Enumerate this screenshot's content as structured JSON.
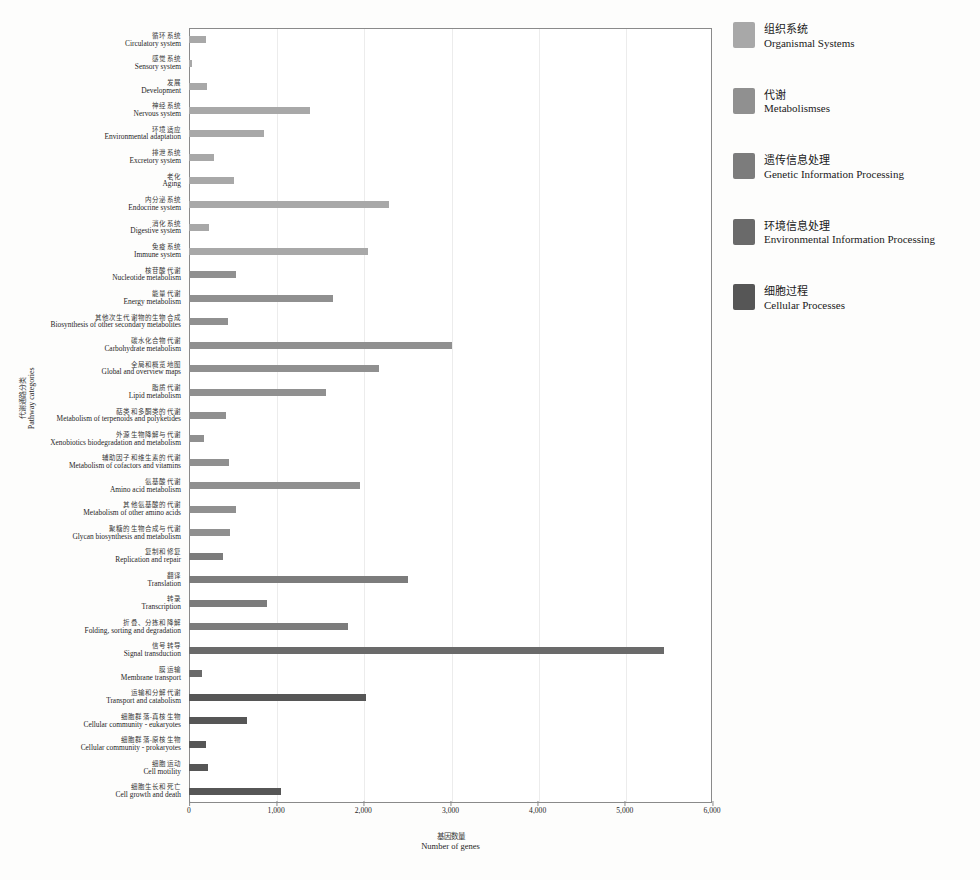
{
  "chart_data": {
    "type": "bar",
    "orientation": "horizontal",
    "title": "",
    "xlabel_cn": "基因数量",
    "xlabel_en": "Number of genes",
    "ylabel_cn": "代谢通路分类",
    "ylabel_en": "Pathway categories",
    "xlim": [
      0,
      6000
    ],
    "xticks": [
      0,
      1000,
      2000,
      3000,
      4000,
      5000,
      6000
    ],
    "xtick_labels": [
      "0",
      "1,000",
      "2,000",
      "3,000",
      "4,000",
      "5,000",
      "6,000"
    ],
    "grid": true,
    "legend_position": "right",
    "categories": [
      {
        "cn": "循环系统",
        "en": "Circulatory system",
        "value": 200,
        "group": "Organismal Systems"
      },
      {
        "cn": "感觉系统",
        "en": "Sensory system",
        "value": 40,
        "group": "Organismal Systems"
      },
      {
        "cn": "发展",
        "en": "Development",
        "value": 210,
        "group": "Organismal Systems"
      },
      {
        "cn": "神经系统",
        "en": "Nervous system",
        "value": 1390,
        "group": "Organismal Systems"
      },
      {
        "cn": "环境适应",
        "en": "Environmental adaptation",
        "value": 860,
        "group": "Organismal Systems"
      },
      {
        "cn": "排泄系统",
        "en": "Excretory system",
        "value": 285,
        "group": "Organismal Systems"
      },
      {
        "cn": "老化",
        "en": "Aging",
        "value": 520,
        "group": "Organismal Systems"
      },
      {
        "cn": "内分泌系统",
        "en": "Endocrine system",
        "value": 2290,
        "group": "Organismal Systems"
      },
      {
        "cn": "消化系统",
        "en": "Digestive system",
        "value": 225,
        "group": "Organismal Systems"
      },
      {
        "cn": "免疫系统",
        "en": "Immune system",
        "value": 2050,
        "group": "Organismal Systems"
      },
      {
        "cn": "核苷酸代谢",
        "en": "Nucleotide metabolism",
        "value": 540,
        "group": "Metabolismses"
      },
      {
        "cn": "能量代谢",
        "en": "Energy metabolism",
        "value": 1650,
        "group": "Metabolismses"
      },
      {
        "cn": "其他次生代谢物的生物合成",
        "en": "Biosynthesis of other secondary metabolites",
        "value": 450,
        "group": "Metabolismses"
      },
      {
        "cn": "碳水化合物代谢",
        "en": "Carbohydrate metabolism",
        "value": 3020,
        "group": "Metabolismses"
      },
      {
        "cn": "全局和概览地图",
        "en": "Global and overview maps",
        "value": 2180,
        "group": "Metabolismses"
      },
      {
        "cn": "脂质代谢",
        "en": "Lipid metabolism",
        "value": 1570,
        "group": "Metabolismses"
      },
      {
        "cn": "萜类和多酮类的代谢",
        "en": "Metabolism of terpenoids and polyketides",
        "value": 420,
        "group": "Metabolismses"
      },
      {
        "cn": "外源生物降解与代谢",
        "en": "Xenobiotics biodegradation and metabolism",
        "value": 175,
        "group": "Metabolismses"
      },
      {
        "cn": "辅助因子和维生素的代谢",
        "en": "Metabolism of cofactors and vitamins",
        "value": 460,
        "group": "Metabolismses"
      },
      {
        "cn": "氨基酸代谢",
        "en": "Amino acid metabolism",
        "value": 1960,
        "group": "Metabolismses"
      },
      {
        "cn": "其他氨基酸的代谢",
        "en": "Metabolism of other amino acids",
        "value": 540,
        "group": "Metabolismses"
      },
      {
        "cn": "聚糖的生物合成与代谢",
        "en": "Glycan biosynthesis and metabolism",
        "value": 470,
        "group": "Metabolismses"
      },
      {
        "cn": "复制和修复",
        "en": "Replication and repair",
        "value": 390,
        "group": "Genetic Information Processing"
      },
      {
        "cn": "翻译",
        "en": "Translation",
        "value": 2510,
        "group": "Genetic Information Processing"
      },
      {
        "cn": "转录",
        "en": "Transcription",
        "value": 900,
        "group": "Genetic Information Processing"
      },
      {
        "cn": "折叠、分拣和降解",
        "en": "Folding, sorting and degradation",
        "value": 1820,
        "group": "Genetic Information Processing"
      },
      {
        "cn": "信号转导",
        "en": "Signal transduction",
        "value": 5450,
        "group": "Environmental Information Processing"
      },
      {
        "cn": "膜运输",
        "en": "Membrane transport",
        "value": 150,
        "group": "Environmental Information Processing"
      },
      {
        "cn": "运输和分解代谢",
        "en": "Transport and catabolism",
        "value": 2030,
        "group": "Cellular Processes"
      },
      {
        "cn": "细胞群落-真核生物",
        "en": "Cellular community - eukaryotes",
        "value": 660,
        "group": "Cellular Processes"
      },
      {
        "cn": "细胞群落-原核生物",
        "en": "Cellular community - prokaryotes",
        "value": 200,
        "group": "Cellular Processes"
      },
      {
        "cn": "细胞运动",
        "en": "Cell motility",
        "value": 215,
        "group": "Cellular Processes"
      },
      {
        "cn": "细胞生长和死亡",
        "en": "Cell growth and death",
        "value": 1060,
        "group": "Cellular Processes"
      }
    ]
  },
  "legend": {
    "items": [
      {
        "cn": "组织系统",
        "en": "Organismal Systems",
        "color": "#a8a8a8"
      },
      {
        "cn": "代谢",
        "en": "Metabolismses",
        "color": "#909090"
      },
      {
        "cn": "遗传信息处理",
        "en": "Genetic Information Processing",
        "color": "#7c7c7c"
      },
      {
        "cn": "环境信息处理",
        "en": "Environmental Information Processing",
        "color": "#6a6a6a"
      },
      {
        "cn": "细胞过程",
        "en": "Cellular Processes",
        "color": "#565656"
      }
    ]
  }
}
